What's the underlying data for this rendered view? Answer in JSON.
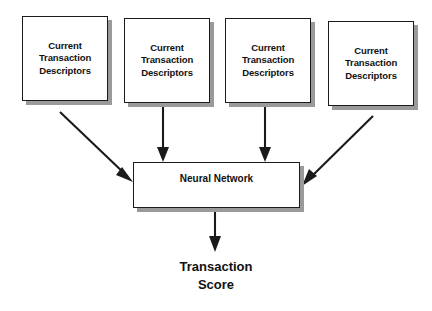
{
  "diagram": {
    "background_color": "#ffffff",
    "line_color": "#1a1a1a",
    "box_fill_color": "#ffffff",
    "shadow_color": "#9a9a9a",
    "input_nodes": [
      {
        "id": "box-1",
        "label": "Current\nTransaction\nDescriptors",
        "line_1": "Current",
        "line_2": "Transaction",
        "line_3": "Descriptors"
      },
      {
        "id": "box-2",
        "label": "Current\nTransaction\nDescriptors",
        "line_1": "Current",
        "line_2": "Transaction",
        "line_3": "Descriptors"
      },
      {
        "id": "box-3",
        "label": "Current\nTransaction\nDescriptors",
        "line_1": "Current",
        "line_2": "Transaction",
        "line_3": "Descriptors"
      },
      {
        "id": "box-4",
        "label": "Current\nTransaction\nDescriptors",
        "line_1": "Current",
        "line_2": "Transaction",
        "line_3": "Descriptors"
      }
    ],
    "process_node": {
      "id": "neural-network-box",
      "label": "Neural Network"
    },
    "output_node": {
      "id": "transaction-score",
      "label": "Transaction\nScore",
      "line_1": "Transaction",
      "line_2": "Score"
    },
    "edges": [
      {
        "from": "box-1",
        "to": "neural-network-box",
        "style": "diagonal-down-right"
      },
      {
        "from": "box-2",
        "to": "neural-network-box",
        "style": "vertical-down"
      },
      {
        "from": "box-3",
        "to": "neural-network-box",
        "style": "vertical-down"
      },
      {
        "from": "box-4",
        "to": "neural-network-box",
        "style": "diagonal-down-left"
      },
      {
        "from": "neural-network-box",
        "to": "transaction-score",
        "style": "vertical-down"
      }
    ]
  }
}
